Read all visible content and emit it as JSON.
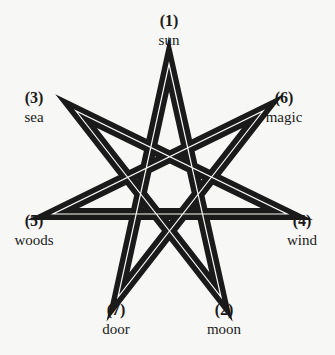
{
  "diagram": {
    "type": "heptagram",
    "colors": {
      "background": "#f7f7f5",
      "star": "#1a1a1a",
      "gap": "#f7f7f5",
      "text": "#1a1a1a"
    },
    "points": [
      {
        "number": "(1)",
        "word": "sun",
        "vertex": [
          169,
          64
        ]
      },
      {
        "number": "(2)",
        "word": "moon",
        "vertex": [
          221,
          297
        ]
      },
      {
        "number": "(3)",
        "word": "sea",
        "vertex": [
          76,
          111
        ]
      },
      {
        "number": "(4)",
        "word": "wind",
        "vertex": [
          287,
          214
        ]
      },
      {
        "number": "(5)",
        "word": "woods",
        "vertex": [
          53,
          214
        ]
      },
      {
        "number": "(6)",
        "word": "magic",
        "vertex": [
          263,
          111
        ]
      },
      {
        "number": "(7)",
        "word": "door",
        "vertex": [
          118,
          297
        ]
      }
    ]
  }
}
